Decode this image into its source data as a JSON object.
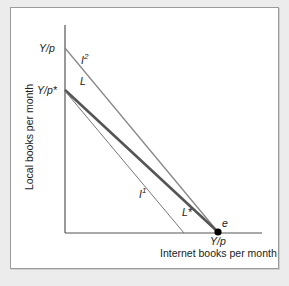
{
  "figure": {
    "y_axis_label": "Local books per month",
    "x_axis_label": "Internet books per month",
    "y_intercepts": {
      "top": "Y/p",
      "lower": "Y/p*"
    },
    "x_intercept": "Y/p",
    "lines": [
      {
        "id": "L",
        "label": "L",
        "style": "medium gray",
        "from": "Y/p (y-axis)",
        "to": "e"
      },
      {
        "id": "L_star",
        "label": "L*",
        "style": "thick dark gray",
        "from": "Y/p* (y-axis)",
        "to": "e"
      },
      {
        "id": "I1",
        "label": "I",
        "superscript": "1",
        "style": "thin gray",
        "type": "indifference"
      },
      {
        "id": "I2",
        "label": "I",
        "superscript": "2",
        "type": "indifference"
      }
    ],
    "point": {
      "label": "e"
    },
    "colors": {
      "background": "#ececec",
      "panel": "#ffffff",
      "axis": "#333333",
      "L": "#888888",
      "L_star": "#555555",
      "I1": "#777777",
      "point": "#000000"
    }
  }
}
